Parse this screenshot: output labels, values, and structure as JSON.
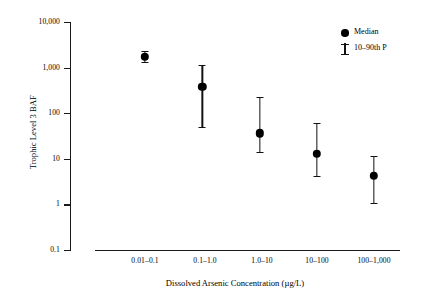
{
  "chart_data": {
    "type": "scatter",
    "title": "",
    "subtitle": "",
    "xlabel": "Dissolved Arsenic Concentration (µg/L)",
    "ylabel": "Trophic Level 3 BAF",
    "yscale": "log",
    "ylim": [
      0.1,
      10000
    ],
    "grid": false,
    "legend_position": "top-right",
    "categories": [
      "0.01–0.1",
      "0.1–1.0",
      "1.0–10",
      "10–100",
      "100–1,000"
    ],
    "y_tick_labels": [
      "10,000",
      "1,000",
      "100",
      "10",
      "1",
      "0.1"
    ],
    "y_tick_values": [
      10000,
      1000,
      100,
      10,
      1,
      0.1
    ],
    "series": [
      {
        "name": "Median",
        "marker": "filled-circle",
        "values": [
          1750,
          380,
          36,
          13,
          4.2
        ]
      },
      {
        "name": "10–90th P",
        "marker": "error-bar",
        "low": [
          1350,
          50,
          14,
          4.3,
          1.1
        ],
        "high": [
          2300,
          1150,
          230,
          62,
          11.5
        ]
      }
    ],
    "points": [
      {
        "category": "0.01–0.1",
        "median": 1750,
        "p10": 1350,
        "p90": 2300
      },
      {
        "category": "0.1–1.0",
        "median": 380,
        "p10": 50,
        "p90": 1150
      },
      {
        "category": "1.0–10",
        "median": 36,
        "p10": 14,
        "p90": 230
      },
      {
        "category": "10–100",
        "median": 13,
        "p10": 4.3,
        "p90": 62
      },
      {
        "category": "100–1,000",
        "median": 4.2,
        "p10": 1.1,
        "p90": 11.5
      }
    ]
  },
  "axes": {
    "y_ticks": [
      {
        "label": "10,000"
      },
      {
        "label": "1,000"
      },
      {
        "label": "100"
      },
      {
        "label": "10"
      },
      {
        "label": "1"
      },
      {
        "label": "0.1"
      }
    ],
    "x_ticks": [
      {
        "label": "0.01–0.1"
      },
      {
        "label": "0.1–1.0"
      },
      {
        "label": "1.0–10"
      },
      {
        "label": "10–100"
      },
      {
        "label": "100–1,000"
      }
    ],
    "x_title": "Dissolved Arsenic Concentration (µg/L)",
    "y_title": "Trophic Level 3 BAF"
  },
  "legend": {
    "entries": [
      {
        "label": "Median",
        "icon": "filled-circle-icon"
      },
      {
        "label": "10–90th P",
        "icon": "error-bar-icon"
      }
    ]
  },
  "colors": {
    "marker": "#000000",
    "axis": "#1a1a1a",
    "background": "#ffffff"
  }
}
